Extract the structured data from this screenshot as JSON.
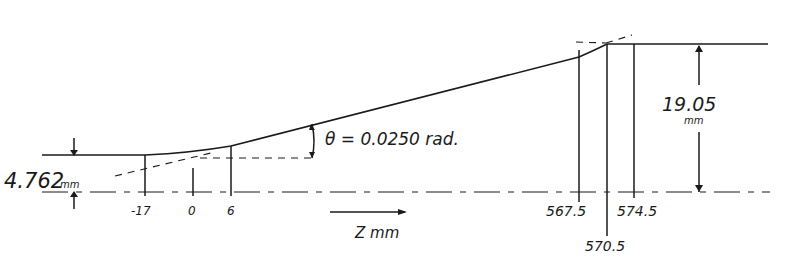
{
  "diagram": {
    "type": "profile-dimension-drawing",
    "labels": {
      "lower_height": "4.762",
      "lower_height_unit": "mm",
      "upper_height": "19.05",
      "upper_height_unit": "mm",
      "angle": "θ = 0.0250 rad.",
      "axis": "Z mm"
    },
    "z_positions": [
      {
        "label": "-17",
        "z": -17
      },
      {
        "label": "0",
        "z": 0
      },
      {
        "label": "6",
        "z": 6
      },
      {
        "label": "567.5",
        "z": 567.5
      },
      {
        "label": "570.5",
        "z": 570.5
      },
      {
        "label": "574.5",
        "z": 574.5
      }
    ],
    "colors": {
      "ink": "#1a1a1a",
      "paper": "#ffffff"
    }
  }
}
